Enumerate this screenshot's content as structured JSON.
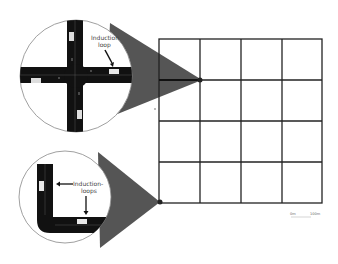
{
  "figure": {
    "type": "road-network-diagram",
    "grid": {
      "rows": 4,
      "cols": 4,
      "left": 159,
      "top": 39,
      "right": 322,
      "bottom": 203
    },
    "insets": [
      {
        "name": "intersection-zoom",
        "label_line1": "Induction",
        "label_line2": "loop",
        "points_to": "interior-node-row1-col1"
      },
      {
        "name": "corner-zoom",
        "label_line1": "Induction-",
        "label_line2": "loops",
        "points_to": "corner-node-bottom-left"
      }
    ],
    "scale_bar": {
      "left_label": "0m",
      "right_label": "100m"
    },
    "colors": {
      "road": "#111111",
      "cone": "#555555",
      "grid": "#222222",
      "loop": "#e8e8e8"
    }
  }
}
